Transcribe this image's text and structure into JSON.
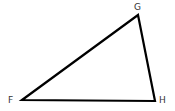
{
  "diagram": {
    "type": "triangle",
    "vertices": [
      {
        "label": "F",
        "x": 22,
        "y": 100,
        "label_x": 8,
        "label_y": 103
      },
      {
        "label": "G",
        "x": 138,
        "y": 15,
        "label_x": 134,
        "label_y": 10
      },
      {
        "label": "H",
        "x": 155,
        "y": 101,
        "label_x": 159,
        "label_y": 103
      }
    ],
    "stroke_color": "#000000"
  }
}
